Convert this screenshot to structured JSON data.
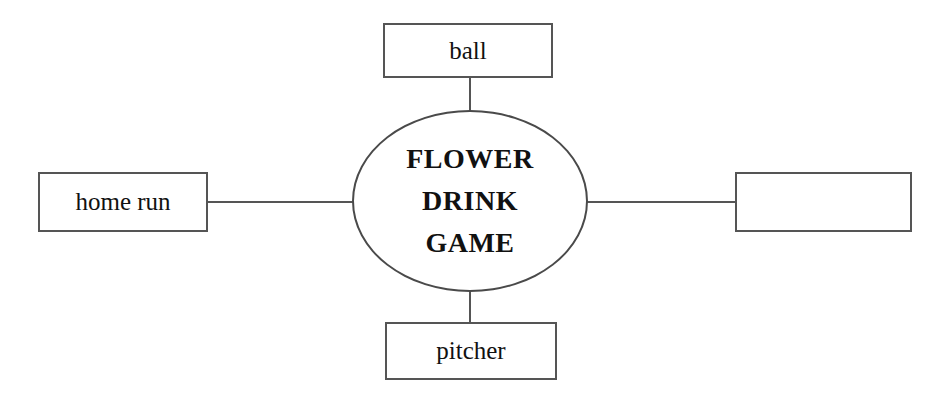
{
  "diagram": {
    "type": "word-web",
    "center": {
      "shape": "ellipse",
      "lines": [
        "FLOWER",
        "DRINK",
        "GAME"
      ]
    },
    "nodes": [
      {
        "id": "top",
        "position": "top",
        "label": "ball",
        "empty": false
      },
      {
        "id": "left",
        "position": "left",
        "label": "home run",
        "empty": false
      },
      {
        "id": "right",
        "position": "right",
        "label": "",
        "empty": true
      },
      {
        "id": "bottom",
        "position": "bottom",
        "label": "pitcher",
        "empty": false
      }
    ],
    "connectors": [
      {
        "from": "center",
        "to": "top"
      },
      {
        "from": "center",
        "to": "left"
      },
      {
        "from": "center",
        "to": "right"
      },
      {
        "from": "center",
        "to": "bottom"
      }
    ],
    "colors": {
      "background": "#ffffff",
      "stroke": "#555555",
      "text": "#111111"
    }
  }
}
